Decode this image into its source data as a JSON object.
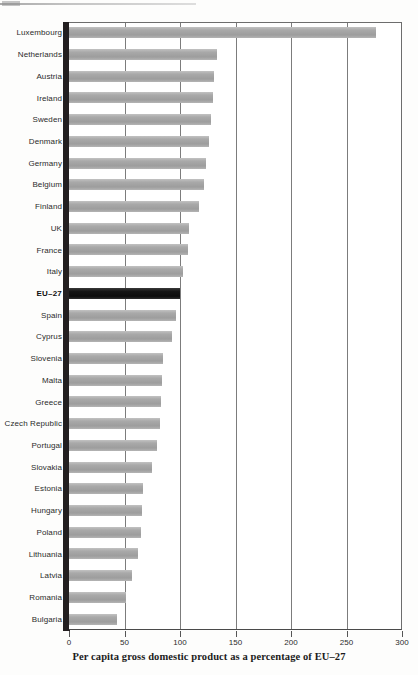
{
  "chart_data": {
    "type": "bar",
    "orientation": "horizontal",
    "title": "",
    "xlabel": "Per capita gross domestic product as a percentage of EU–27",
    "ylabel": "",
    "xlim": [
      0,
      300
    ],
    "xticks": [
      0,
      50,
      100,
      150,
      200,
      250,
      300
    ],
    "xtick_labels": [
      "0",
      "50",
      "100",
      "150",
      "200",
      "250",
      "300"
    ],
    "grid": true,
    "grid_axis": "x",
    "legend": false,
    "highlight_category": "EU–27",
    "highlight_color": "#111111",
    "bar_color": "#a9a9a9",
    "categories": [
      "Luxembourg",
      "Netherlands",
      "Austria",
      "Ireland",
      "Sweden",
      "Denmark",
      "Germany",
      "Belgium",
      "Finland",
      "UK",
      "France",
      "Italy",
      "EU–27",
      "Spain",
      "Cyprus",
      "Slovenia",
      "Malta",
      "Greece",
      "Czech Republic",
      "Portugal",
      "Slovakia",
      "Estonia",
      "Hungary",
      "Poland",
      "Lithuania",
      "Latvia",
      "Romania",
      "Bulgaria"
    ],
    "values": [
      277,
      133,
      131,
      130,
      128,
      126,
      123,
      122,
      117,
      108,
      107,
      103,
      100,
      96,
      93,
      85,
      84,
      83,
      82,
      79,
      75,
      67,
      66,
      65,
      62,
      57,
      51,
      43
    ],
    "annotations": []
  },
  "caption": {
    "text": "Per capita gross domestic product as a percentage of EU–27"
  },
  "axis": {
    "ticks": [
      "0",
      "50",
      "100",
      "150",
      "200",
      "250",
      "300"
    ]
  }
}
